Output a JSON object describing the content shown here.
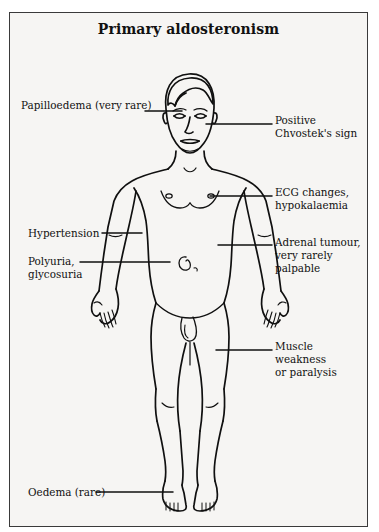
{
  "page": {
    "corner_mark": "",
    "background_color": "#f6f5f3",
    "border_color": "#3a3a3a",
    "ink_color": "#101010"
  },
  "figure": {
    "title": "Primary aldosteronism",
    "annotations": [
      {
        "id": "papilloedema",
        "label": "Papilloedema (very rare)",
        "side": "left",
        "target": "eyes",
        "text_x": 11,
        "text_y": 86,
        "leader_x1": 135,
        "leader_y1": 98,
        "leader_x2": 172,
        "leader_y2": 98
      },
      {
        "id": "chvostek",
        "label": "Positive\nChvostek's sign",
        "side": "right",
        "target": "cheek / facial nerve",
        "text_x": 265,
        "text_y": 101,
        "leader_x1": 196,
        "leader_y1": 111,
        "leader_x2": 262,
        "leader_y2": 111
      },
      {
        "id": "ecg-changes",
        "label": "ECG changes,\nhypokalaemia",
        "side": "right",
        "target": "heart / chest",
        "text_x": 265,
        "text_y": 173,
        "leader_x1": 200,
        "leader_y1": 183,
        "leader_x2": 262,
        "leader_y2": 183
      },
      {
        "id": "hypertension",
        "label": "Hypertension",
        "side": "left",
        "target": "upper arm / blood pressure",
        "text_x": 18,
        "text_y": 214,
        "leader_x1": 92,
        "leader_y1": 220,
        "leader_x2": 132,
        "leader_y2": 220
      },
      {
        "id": "adrenal-tumour",
        "label": "Adrenal tumour,\nvery rarely palpable",
        "side": "right",
        "target": "adrenal region / flank",
        "text_x": 265,
        "text_y": 223,
        "leader_x1": 208,
        "leader_y1": 232,
        "leader_x2": 262,
        "leader_y2": 232
      },
      {
        "id": "polyuria",
        "label": "Polyuria,\nglycosuria",
        "side": "left",
        "target": "kidney / abdomen",
        "text_x": 18,
        "text_y": 242,
        "leader_x1": 70,
        "leader_y1": 249,
        "leader_x2": 160,
        "leader_y2": 249
      },
      {
        "id": "muscle-weakness",
        "label": "Muscle weakness\nor paralysis",
        "side": "right",
        "target": "thigh muscles",
        "text_x": 265,
        "text_y": 327,
        "leader_x1": 206,
        "leader_y1": 337,
        "leader_x2": 262,
        "leader_y2": 337
      },
      {
        "id": "oedema",
        "label": "Oedema (rare)",
        "side": "left",
        "target": "ankle",
        "text_x": 18,
        "text_y": 473,
        "leader_x1": 86,
        "leader_y1": 479,
        "leader_x2": 163,
        "leader_y2": 479
      }
    ]
  }
}
